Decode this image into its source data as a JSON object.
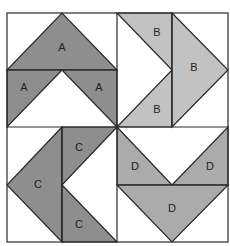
{
  "diagram": {
    "colors": {
      "A": "#8e8e8e",
      "B": "#c2c2c2",
      "C": "#8e8e8e",
      "D": "#ababab",
      "background": "#ffffff",
      "outline": "#2a2a2a"
    },
    "blocks": [
      {
        "id": "top-left",
        "pieces": [
          {
            "label": "A",
            "points": "7,70 62,13 117,70",
            "label_pos": [
              62,
              48
            ]
          },
          {
            "label": "A",
            "points": "7,70 62,70 7,127",
            "label_pos": [
              24,
              88
            ]
          },
          {
            "label": "A",
            "points": "62,70 117,70 117,127",
            "label_pos": [
              99,
              88
            ]
          }
        ]
      },
      {
        "id": "top-right",
        "pieces": [
          {
            "label": "B",
            "points": "117,13 172,13 172,70",
            "label_pos": [
              157,
              33
            ]
          },
          {
            "label": "B",
            "points": "117,127 172,70 172,127",
            "label_pos": [
              157,
              110
            ]
          },
          {
            "label": "B",
            "points": "172,13 228,70 172,127",
            "label_pos": [
              194,
              68
            ]
          }
        ]
      },
      {
        "id": "bottom-left",
        "pieces": [
          {
            "label": "C",
            "points": "62,127 7,185 62,242",
            "label_pos": [
              38,
              185
            ]
          },
          {
            "label": "C",
            "points": "62,127 117,127 62,185",
            "label_pos": [
              79,
              148
            ]
          },
          {
            "label": "C",
            "points": "62,185 117,242 62,242",
            "label_pos": [
              79,
              225
            ]
          }
        ]
      },
      {
        "id": "bottom-right",
        "pieces": [
          {
            "label": "D",
            "points": "117,127 172,185 117,185",
            "label_pos": [
              135,
              167
            ]
          },
          {
            "label": "D",
            "points": "228,127 228,185 172,185",
            "label_pos": [
              210,
              167
            ]
          },
          {
            "label": "D",
            "points": "117,185 228,185 172,242",
            "label_pos": [
              172,
              209
            ]
          }
        ]
      }
    ],
    "bounds": {
      "left": 7,
      "top": 13,
      "right": 228,
      "bottom": 242,
      "mid_x": 117,
      "mid_y": 127
    }
  }
}
